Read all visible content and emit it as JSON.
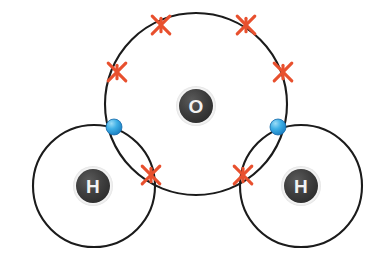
{
  "diagram": {
    "type": "dot-and-cross covalent bonding diagram",
    "molecule_formula": "H2O",
    "molecule_name": "water",
    "background_color": "#ffffff",
    "electron_dot_color": "#2AA4E0",
    "electron_cross_color": "#E8502E",
    "shell_line_color": "#1B1B1B",
    "nucleus_fill_color": "#3A3A3A",
    "nucleus_text_color": "#F2F2F2",
    "atoms": [
      {
        "id": "oxygen",
        "symbol": "O",
        "nucleus_cx": 196,
        "nucleus_cy": 106,
        "nucleus_r": 17,
        "shell_cx": 196,
        "shell_cy": 104,
        "shell_r": 91,
        "label_size": 19
      },
      {
        "id": "hydrogen-left",
        "symbol": "H",
        "nucleus_cx": 93,
        "nucleus_cy": 186,
        "nucleus_r": 17,
        "shell_cx": 94,
        "shell_cy": 186,
        "shell_r": 61,
        "label_size": 19
      },
      {
        "id": "hydrogen-right",
        "symbol": "H",
        "nucleus_cx": 301,
        "nucleus_cy": 186,
        "nucleus_r": 17,
        "shell_cx": 301,
        "shell_cy": 186,
        "shell_r": 61,
        "label_size": 19
      }
    ],
    "electrons_cross": [
      {
        "id": "lone-pair-top-left",
        "cx": 161,
        "cy": 25,
        "size": 11,
        "owner": "oxygen"
      },
      {
        "id": "lone-pair-top-right",
        "cx": 246,
        "cy": 25,
        "size": 11,
        "owner": "oxygen"
      },
      {
        "id": "lone-pair-upper-left",
        "cx": 117,
        "cy": 72,
        "size": 11,
        "owner": "oxygen"
      },
      {
        "id": "lone-pair-upper-right",
        "cx": 283,
        "cy": 72,
        "size": 11,
        "owner": "oxygen"
      },
      {
        "id": "bond-pair-left",
        "cx": 151,
        "cy": 175,
        "size": 11,
        "owner": "oxygen"
      },
      {
        "id": "bond-pair-right",
        "cx": 243,
        "cy": 175,
        "size": 11,
        "owner": "oxygen"
      }
    ],
    "electrons_dot": [
      {
        "id": "bond-electron-left",
        "cx": 114,
        "cy": 127,
        "r": 8,
        "owner": "hydrogen-left"
      },
      {
        "id": "bond-electron-right",
        "cx": 278,
        "cy": 127,
        "r": 8,
        "owner": "hydrogen-right"
      }
    ]
  }
}
